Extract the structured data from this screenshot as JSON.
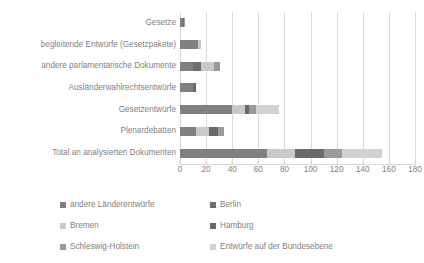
{
  "chart_data": {
    "type": "bar",
    "orientation": "horizontal",
    "stacked": true,
    "title": "",
    "xlabel": "",
    "ylabel": "",
    "xlim": [
      0,
      180
    ],
    "xticks": [
      0,
      20,
      40,
      60,
      80,
      100,
      120,
      140,
      160,
      180
    ],
    "grid": true,
    "legend_position": "bottom",
    "categories": [
      "Gesetze",
      "begleitende Entwürfe (Gesetzpakete)",
      "andere parlamentarische Dokumente",
      "Ausländerwahlrechtsentwürfe",
      "Gesetzentwürfe",
      "Plenardebatten",
      "Total an analysierten Dokumenten"
    ],
    "series": [
      {
        "name": "andere Länderentwürfe",
        "color": "#808080",
        "values": [
          2,
          14,
          10,
          10,
          40,
          12,
          67
        ]
      },
      {
        "name": "Berlin",
        "color": "#6e6e6e",
        "values": [
          1,
          0,
          6,
          0,
          0,
          0,
          0
        ]
      },
      {
        "name": "Bremen",
        "color": "#c9c9c9",
        "values": [
          0,
          2,
          10,
          0,
          10,
          10,
          21
        ]
      },
      {
        "name": "Hamburg",
        "color": "#696969",
        "values": [
          0,
          0,
          0,
          2,
          3,
          7,
          22
        ]
      },
      {
        "name": "Schleswig-Holstein",
        "color": "#9a9a9a",
        "values": [
          1,
          0,
          5,
          0,
          5,
          5,
          14
        ]
      },
      {
        "name": "Entwürfe auf der Bundesebene",
        "color": "#d2d2d2",
        "values": [
          0,
          0,
          0,
          0,
          18,
          0,
          31
        ]
      }
    ]
  },
  "legend": {
    "entries": [
      {
        "label": "andere Länderentwürfe",
        "color": "#808080"
      },
      {
        "label": "Berlin",
        "color": "#6e6e6e"
      },
      {
        "label": "Bremen",
        "color": "#c9c9c9"
      },
      {
        "label": "Hamburg",
        "color": "#696969"
      },
      {
        "label": "Schleswig-Holstein",
        "color": "#9a9a9a"
      },
      {
        "label": "Entwürfe auf der Bundesebene",
        "color": "#d2d2d2"
      }
    ]
  },
  "colors": {
    "grid": "#d9d9d9",
    "text": "#7f7f7f",
    "background": "#ffffff"
  }
}
